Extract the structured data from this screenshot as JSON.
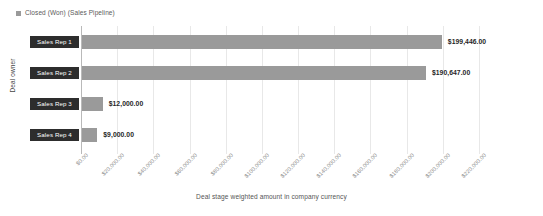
{
  "legend": {
    "marker": "square-swatch",
    "label": "Closed (Won) (Sales Pipeline)",
    "color": "#9a9a9a"
  },
  "axes": {
    "y_title": "Deal owner",
    "x_title": "Deal stage weighted amount in company currency"
  },
  "chart_data": {
    "type": "bar",
    "orientation": "horizontal",
    "title": "",
    "subtitle": "",
    "xlabel": "Deal stage weighted amount in company currency",
    "ylabel": "Deal owner",
    "categories": [
      "Sales Rep 1",
      "Sales Rep 2",
      "Sales Rep 3",
      "Sales Rep 4"
    ],
    "values": [
      199446.0,
      190647.0,
      12000.0,
      9000.0
    ],
    "value_labels": [
      "$199,446.00",
      "$190,647.00",
      "$12,000.00",
      "$9,000.00"
    ],
    "series": [
      {
        "name": "Closed (Won) (Sales Pipeline)",
        "color": "#9a9a9a",
        "values": [
          199446.0,
          190647.0,
          12000.0,
          9000.0
        ]
      }
    ],
    "xlim": [
      0,
      220000
    ],
    "xtick_step": 20000,
    "xticks": [
      0,
      20000,
      40000,
      60000,
      80000,
      100000,
      120000,
      140000,
      160000,
      180000,
      200000,
      220000
    ],
    "xtick_labels": [
      "$0.00",
      "$20,000.00",
      "$40,000.00",
      "$60,000.00",
      "$80,000.00",
      "$100,000.00",
      "$120,000.00",
      "$140,000.00",
      "$160,000.00",
      "$180,000.00",
      "$200,000.00",
      "$220,000.00"
    ],
    "grid": {
      "vertical": true,
      "horizontal": false
    },
    "legend_position": "top-left",
    "bar_color": "#9a9a9a",
    "category_badge_color": "#2d2d2d",
    "category_badge_text_color": "#ffffff"
  }
}
